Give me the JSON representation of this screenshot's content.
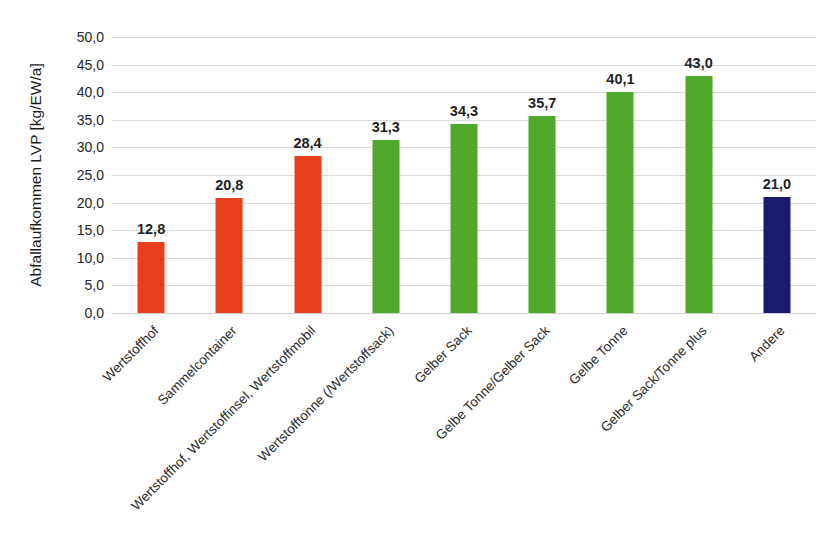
{
  "chart_data": {
    "type": "bar",
    "title": "",
    "subtitle": "",
    "xlabel": "",
    "ylabel": "Abfallaufkommen LVP [kg/EW/a]",
    "ylim": [
      0,
      50
    ],
    "ytick_step": 5,
    "grid": true,
    "legend": "none",
    "decimal_separator": ",",
    "categories": [
      "Wertstoffhof",
      "Sammelcontainer",
      "Wertstoffhof, Wertstoffinsel, Wertstoffmobil",
      "Wertstofftonne (/Wertstoffsack)",
      "Gelber Sack",
      "Gelbe Tonne/Gelber Sack",
      "Gelbe Tonne",
      "Gelber Sack/Tonne plus",
      "Andere"
    ],
    "values": [
      12.8,
      20.8,
      28.4,
      31.3,
      34.3,
      35.7,
      40.1,
      43.0,
      21.0
    ],
    "value_labels": [
      "12,8",
      "20,8",
      "28,4",
      "31,3",
      "34,3",
      "35,7",
      "40,1",
      "43,0",
      "21,0"
    ],
    "bar_colors": [
      "#E8401C",
      "#E8401C",
      "#E8401C",
      "#4FA82A",
      "#4FA82A",
      "#4FA82A",
      "#4FA82A",
      "#4FA82A",
      "#1A1A6E"
    ],
    "ytick_labels": [
      "50,0",
      "45,0",
      "40,0",
      "35,0",
      "30,0",
      "25,0",
      "20,0",
      "15,0",
      "10,0",
      "5,0",
      "0,0"
    ],
    "ytick_values": [
      50,
      45,
      40,
      35,
      30,
      25,
      20,
      15,
      10,
      5,
      0
    ],
    "colors": {
      "orange": "#E8401C",
      "green": "#4FA82A",
      "navy": "#1A1A6E",
      "gridline": "#d9d9d9",
      "text": "#262626",
      "background": "#ffffff"
    }
  }
}
